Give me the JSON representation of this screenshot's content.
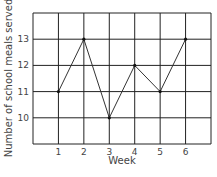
{
  "chart_data": {
    "type": "line",
    "title": "",
    "xlabel": "Week",
    "ylabel": "Number of school meals served",
    "x": [
      1,
      2,
      3,
      4,
      5,
      6
    ],
    "values": [
      11,
      13,
      10,
      12,
      11,
      13
    ],
    "xticks": [
      "1",
      "2",
      "3",
      "4",
      "5",
      "6"
    ],
    "yticks": [
      "10",
      "11",
      "12",
      "13"
    ],
    "xlim": [
      0,
      7
    ],
    "ylim": [
      9,
      14
    ],
    "grid": true,
    "legend": null
  }
}
